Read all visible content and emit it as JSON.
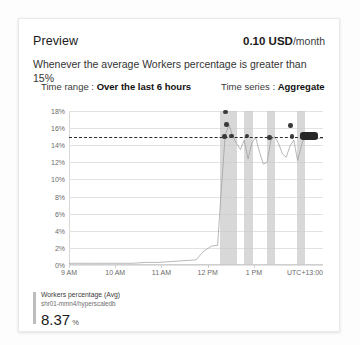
{
  "card": {
    "title": "Preview",
    "price_amount": "0.10 USD",
    "price_period": "/month",
    "description": "Whenever the average Workers percentage is greater than 15%",
    "time_range_label": "Time range :",
    "time_range_value": "Over the last 6 hours",
    "time_series_label": "Time series :",
    "time_series_value": "Aggregate"
  },
  "legend": {
    "metric_name": "Workers percentage (Avg)",
    "resource": "shr01-mmn4/hyperscaledb",
    "value": "8.37",
    "unit": "%"
  },
  "colors": {
    "threshold_line": "#2b2b2b",
    "band": "#c9c9c9",
    "series_line": "#9a9a9a",
    "violation_dot": "#3a3a3a",
    "grid": "#e2e2e2"
  },
  "chart_data": {
    "type": "line",
    "title": "",
    "xlabel": "",
    "ylabel": "",
    "ylim": [
      0,
      18
    ],
    "ytick_step": 2,
    "ytick_labels": [
      "18%",
      "16%",
      "14%",
      "12%",
      "10%",
      "8%",
      "6%",
      "4%",
      "2%",
      "0%"
    ],
    "ytick_values": [
      18,
      16,
      14,
      12,
      10,
      8,
      6,
      4,
      2,
      0
    ],
    "xtick_labels": [
      "9 AM",
      "10 AM",
      "11 AM",
      "12 PM",
      "1 PM"
    ],
    "xtick_positions": [
      0.0,
      0.182,
      0.364,
      0.546,
      0.728
    ],
    "timezone_label": "UTC+13:00",
    "grid": true,
    "legend_position": "below-left",
    "threshold": 15,
    "threshold_style": "dashed",
    "series": [
      {
        "name": "Workers percentage (Avg)",
        "x": [
          0.0,
          0.05,
          0.1,
          0.15,
          0.2,
          0.25,
          0.3,
          0.35,
          0.4,
          0.45,
          0.5,
          0.53,
          0.56,
          0.585,
          0.6,
          0.615,
          0.63,
          0.645,
          0.66,
          0.675,
          0.69,
          0.705,
          0.72,
          0.735,
          0.75,
          0.765,
          0.78,
          0.795,
          0.81,
          0.825,
          0.84,
          0.855,
          0.87,
          0.885,
          0.9,
          0.92,
          0.94,
          0.96,
          1.0
        ],
        "values": [
          0.2,
          0.2,
          0.2,
          0.2,
          0.2,
          0.2,
          0.3,
          0.3,
          0.4,
          0.5,
          0.6,
          1.6,
          2.2,
          2.3,
          9.0,
          15.2,
          16.4,
          15.0,
          14.2,
          13.5,
          14.6,
          12.4,
          14.3,
          14.9,
          13.2,
          11.8,
          12.0,
          14.6,
          15.0,
          14.2,
          13.0,
          12.6,
          13.9,
          14.6,
          12.2,
          14.5,
          14.9,
          14.8,
          14.8
        ]
      }
    ],
    "violation_points": [
      {
        "x": 0.613,
        "y": 15.0
      },
      {
        "x": 0.64,
        "y": 15.1
      },
      {
        "x": 0.62,
        "y": 16.4
      },
      {
        "x": 0.617,
        "y": 17.9
      },
      {
        "x": 0.7,
        "y": 15.1
      },
      {
        "x": 0.79,
        "y": 14.9
      },
      {
        "x": 0.878,
        "y": 15.0
      },
      {
        "x": 0.872,
        "y": 16.3
      }
    ],
    "alert_bands": [
      {
        "start": 0.595,
        "end": 0.66
      },
      {
        "start": 0.69,
        "end": 0.723
      },
      {
        "start": 0.78,
        "end": 0.812
      },
      {
        "start": 0.898,
        "end": 0.93
      }
    ],
    "marker_box": {
      "x": 0.945,
      "y": 15.0
    }
  }
}
